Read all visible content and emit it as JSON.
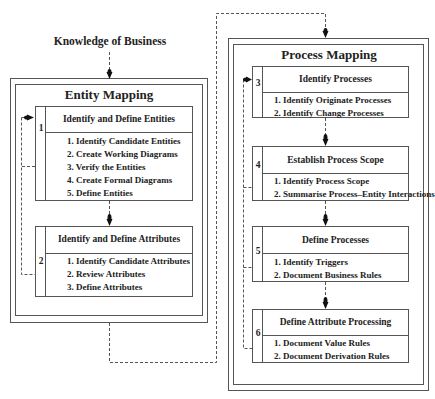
{
  "input_label": "Knowledge of Business",
  "entity_mapping": {
    "title": "Entity Mapping",
    "steps": [
      {
        "number": "1",
        "title": "Identify and Define Entities",
        "items": [
          "1. Identify Candidate Entities",
          "2. Create Working Diagrams",
          "3. Verify the Entities",
          "4. Create Formal Diagrams",
          "5. Define Entities"
        ]
      },
      {
        "number": "2",
        "title": "Identify and Define Attributes",
        "items": [
          "1. Identify Candidate Attributes",
          "2. Review Attributes",
          "3. Define Attributes"
        ]
      }
    ]
  },
  "process_mapping": {
    "title": "Process Mapping",
    "steps": [
      {
        "number": "3",
        "title": "Identify Processes",
        "items": [
          "1. Identify Originate Processes",
          "2. Identify Change Processes"
        ]
      },
      {
        "number": "4",
        "title": "Establish Process Scope",
        "items": [
          "1. Identify Process Scope",
          "2. Summarise Process–Entity Interactions"
        ]
      },
      {
        "number": "5",
        "title": "Define Processes",
        "items": [
          "1. Identify Triggers",
          "2. Document Business Rules"
        ]
      },
      {
        "number": "6",
        "title": "Define Attribute Processing",
        "items": [
          "1. Document Value Rules",
          "2. Document Derivation Rules"
        ]
      }
    ]
  },
  "colors": {
    "line": "#555555",
    "text": "#222222",
    "background": "#ffffff"
  }
}
